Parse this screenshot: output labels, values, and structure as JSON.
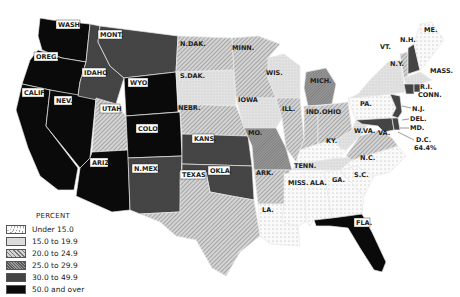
{
  "map": {
    "type": "choropleth",
    "region": "United States",
    "legend": {
      "title": "PERCENT",
      "classes": [
        {
          "id": "c0",
          "label": "Under 15.0",
          "color": "#f6f6f6",
          "pattern": "dots"
        },
        {
          "id": "c1",
          "label": "15.0 to 19.9",
          "color": "#dcdcdc",
          "pattern": "fine-dots"
        },
        {
          "id": "c2",
          "label": "20.0 to 24.9",
          "color": "#b8b8b8",
          "pattern": "diagonal-lines"
        },
        {
          "id": "c3",
          "label": "25.0 to 29.9",
          "color": "#8a8a8a",
          "pattern": "dense-lines"
        },
        {
          "id": "c4",
          "label": "30.0 to 49.9",
          "color": "#4a4a4a",
          "pattern": "crosshatch"
        },
        {
          "id": "c5",
          "label": "50.0 and over",
          "color": "#0a0a0a",
          "pattern": "solid"
        }
      ]
    },
    "states": [
      {
        "name": "WASH",
        "class": "c5"
      },
      {
        "name": "OREG",
        "class": "c5"
      },
      {
        "name": "CALIF",
        "class": "c5"
      },
      {
        "name": "NEV",
        "class": "c5"
      },
      {
        "name": "ARIZ",
        "class": "c5"
      },
      {
        "name": "IDAHO",
        "class": "c4"
      },
      {
        "name": "MONT",
        "class": "c4"
      },
      {
        "name": "WYO",
        "class": "c5"
      },
      {
        "name": "UTAH",
        "class": "c2"
      },
      {
        "name": "COLO",
        "class": "c5"
      },
      {
        "name": "N.MEX",
        "class": "c4"
      },
      {
        "name": "N.DAK",
        "class": "c2"
      },
      {
        "name": "S.DAK",
        "class": "c1"
      },
      {
        "name": "NEBR",
        "class": "c2"
      },
      {
        "name": "KANS",
        "class": "c4"
      },
      {
        "name": "OKLA",
        "class": "c4"
      },
      {
        "name": "TEXAS",
        "class": "c2"
      },
      {
        "name": "MINN",
        "class": "c2"
      },
      {
        "name": "IOWA",
        "class": "c1"
      },
      {
        "name": "MO",
        "class": "c3"
      },
      {
        "name": "ARK",
        "class": "c2"
      },
      {
        "name": "LA",
        "class": "c0"
      },
      {
        "name": "WIS",
        "class": "c1"
      },
      {
        "name": "ILL",
        "class": "c2"
      },
      {
        "name": "MICH",
        "class": "c3"
      },
      {
        "name": "IND",
        "class": "c2"
      },
      {
        "name": "OHIO",
        "class": "c2"
      },
      {
        "name": "KY",
        "class": "c0"
      },
      {
        "name": "TENN",
        "class": "c1"
      },
      {
        "name": "MISS",
        "class": "c0"
      },
      {
        "name": "ALA",
        "class": "c0"
      },
      {
        "name": "GA",
        "class": "c0"
      },
      {
        "name": "FLA",
        "class": "c5"
      },
      {
        "name": "S.C",
        "class": "c0"
      },
      {
        "name": "N.C",
        "class": "c0"
      },
      {
        "name": "VA",
        "class": "c2"
      },
      {
        "name": "W.VA",
        "class": "c1"
      },
      {
        "name": "PA",
        "class": "c0"
      },
      {
        "name": "N.Y",
        "class": "c1"
      },
      {
        "name": "VT",
        "class": "c2"
      },
      {
        "name": "N.H",
        "class": "c4"
      },
      {
        "name": "ME",
        "class": "c0"
      },
      {
        "name": "MASS",
        "class": "c1"
      },
      {
        "name": "R.I",
        "class": "c4"
      },
      {
        "name": "CONN",
        "class": "c4"
      },
      {
        "name": "N.J",
        "class": "c4"
      },
      {
        "name": "DEL",
        "class": "c4"
      },
      {
        "name": "MD",
        "class": "c4"
      }
    ],
    "annotations": {
      "dc_label": "D.C.",
      "dc_value": "64.4%"
    },
    "labels": {
      "WASH": "WASH.",
      "OREG": "OREG.",
      "CALIF": "CALIF.",
      "NEV": "NEV.",
      "ARIZ": "ARIZ.",
      "IDAHO": "IDAHO",
      "MONT": "MONT.",
      "WYO": "WYO.",
      "UTAH": "UTAH",
      "COLO": "COLO.",
      "NMEX": "N.MEX.",
      "NDAK": "N.DAK.",
      "SDAK": "S.DAK.",
      "NEBR": "NEBR.",
      "KANS": "KANS.",
      "OKLA": "OKLA.",
      "TEXAS": "TEXAS",
      "MINN": "MINN.",
      "IOWA": "IOWA",
      "MO": "MO.",
      "ARK": "ARK.",
      "LA": "LA.",
      "WIS": "WIS.",
      "ILL": "ILL.",
      "MICH": "MICH.",
      "IND": "IND.",
      "OHIO": "OHIO",
      "KY": "KY.",
      "TENN": "TENN.",
      "MISS": "MISS.",
      "ALA": "ALA.",
      "GA": "GA.",
      "FLA": "FLA.",
      "SC": "S.C.",
      "NC": "N.C.",
      "VA": "VA.",
      "WVA": "W.VA.",
      "PA": "PA.",
      "NY": "N.Y.",
      "VT": "VT.",
      "NH": "N.H.",
      "ME": "ME.",
      "MASS": "MASS.",
      "RI": "R.I.",
      "CONN": "CONN.",
      "NJ": "N.J.",
      "DEL": "DEL.",
      "MD": "MD."
    }
  }
}
